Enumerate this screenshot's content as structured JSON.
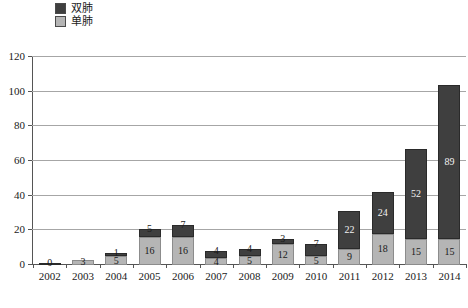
{
  "legend": {
    "position": "top-left",
    "items": [
      {
        "label": "双肺",
        "color": "#3f3f3f",
        "key": "double_lung"
      },
      {
        "label": "单肺",
        "color": "#b5b5b5",
        "key": "single_lung"
      }
    ]
  },
  "axis": {
    "y_ticks": [
      "0",
      "20",
      "40",
      "60",
      "80",
      "100",
      "120"
    ],
    "x_ticks": [
      "2002",
      "2003",
      "2004",
      "2005",
      "2006",
      "2007",
      "2008",
      "2009",
      "2010",
      "2011",
      "2012",
      "2013",
      "2014"
    ]
  },
  "chart_data": {
    "type": "bar",
    "stacked": true,
    "title": "",
    "subtitle": "",
    "xlabel": "",
    "ylabel": "",
    "ylim": [
      0,
      120
    ],
    "ytick_step": 20,
    "grid": true,
    "legend_position": "top-left",
    "categories": [
      "2002",
      "2003",
      "2004",
      "2005",
      "2006",
      "2007",
      "2008",
      "2009",
      "2010",
      "2011",
      "2012",
      "2013",
      "2014"
    ],
    "series": [
      {
        "name": "单肺",
        "color": "#b5b5b5",
        "values": [
          0,
          3,
          5,
          16,
          16,
          4,
          5,
          12,
          5,
          9,
          18,
          15,
          15
        ],
        "labels": [
          "",
          "3",
          "5",
          "16",
          "16",
          "4",
          "5",
          "12",
          "5",
          "9",
          "18",
          "15",
          "15"
        ]
      },
      {
        "name": "双肺",
        "color": "#3f3f3f",
        "values": [
          0,
          0,
          1,
          5,
          7,
          4,
          4,
          3,
          7,
          22,
          24,
          52,
          89
        ],
        "labels": [
          "0",
          "",
          "1",
          "5",
          "7",
          "4",
          "4",
          "3",
          "7",
          "22",
          "24",
          "52",
          "89"
        ]
      }
    ],
    "totals": [
      0,
      3,
      6,
      21,
      23,
      8,
      9,
      15,
      12,
      31,
      42,
      67,
      104
    ]
  }
}
